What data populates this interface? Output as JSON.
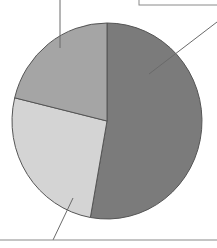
{
  "chart_data": {
    "type": "pie",
    "title": "",
    "labels_visible": false,
    "note": "Callout label text is cropped out of frame; slice shares estimated from geometry.",
    "start_angle_deg": -90,
    "direction": "clockwise",
    "slices": [
      {
        "name": "slice-dark",
        "value": 52.8,
        "color": "#7b7b7b"
      },
      {
        "name": "slice-light",
        "value": 26.0,
        "color": "#d4d4d4"
      },
      {
        "name": "slice-medium",
        "value": 21.2,
        "color": "#a5a5a5"
      }
    ],
    "center": [
      107,
      121
    ],
    "radius": [
      95,
      98
    ],
    "outline_color": "#555555",
    "callouts": [
      {
        "slice": "slice-medium",
        "from": [
          60,
          48
        ],
        "to": [
          60,
          0
        ]
      },
      {
        "slice": "slice-dark",
        "from": [
          149,
          74
        ],
        "to": [
          217,
          22
        ]
      },
      {
        "slice": "slice-light",
        "from": [
          73,
          198
        ],
        "to": [
          53,
          240
        ]
      }
    ],
    "label_box": {
      "x": 139,
      "y": -20,
      "width": 100,
      "height": 25
    },
    "baseline": {
      "y": 240,
      "x1": 0,
      "x2": 217
    }
  }
}
